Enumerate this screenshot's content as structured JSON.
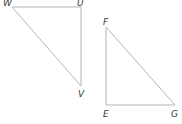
{
  "diagram": {
    "type": "geometry-right-triangles",
    "line_color": "#b5b5b5",
    "label_color": "#3a3a3a",
    "triangles": [
      {
        "name": "WUV",
        "vertices": [
          {
            "label": "W",
            "x": 12,
            "y": 7,
            "label_x": 3,
            "label_y": 6
          },
          {
            "label": "U",
            "x": 81,
            "y": 7,
            "label_x": 77,
            "label_y": 6
          },
          {
            "label": "V",
            "x": 81,
            "y": 86,
            "label_x": 78,
            "label_y": 97
          }
        ],
        "right_angle_at": "U"
      },
      {
        "name": "FEG",
        "vertices": [
          {
            "label": "F",
            "x": 106,
            "y": 27,
            "label_x": 103,
            "label_y": 25
          },
          {
            "label": "E",
            "x": 106,
            "y": 105,
            "label_x": 103,
            "label_y": 117
          },
          {
            "label": "G",
            "x": 175,
            "y": 105,
            "label_x": 171,
            "label_y": 117
          }
        ],
        "right_angle_at": "E"
      }
    ]
  }
}
